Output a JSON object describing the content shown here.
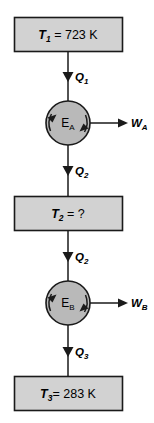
{
  "diagram": {
    "colors": {
      "box_fill": "#d2d2d2",
      "circle_fill": "#b9b9b9",
      "stroke": "#1a1a1a",
      "background": "#ffffff"
    },
    "reservoirs": [
      {
        "id": "reservoir-top",
        "symbol": "T",
        "subscript": "1",
        "equals": " = ",
        "value": "723 K",
        "full_text": "T1 = 723 K"
      },
      {
        "id": "reservoir-middle",
        "symbol": "T",
        "subscript": "2",
        "equals": " = ",
        "value": "?",
        "full_text": "T2 = ?"
      },
      {
        "id": "reservoir-bottom",
        "symbol": "T",
        "subscript": "3",
        "equals": "= ",
        "value": "283 K",
        "full_text": "T3= 283 K"
      }
    ],
    "engines": [
      {
        "id": "engine-a",
        "symbol": "E",
        "subscript": "A",
        "full_text": "EA"
      },
      {
        "id": "engine-b",
        "symbol": "E",
        "subscript": "B",
        "full_text": "EB"
      }
    ],
    "heat_flows": [
      {
        "id": "heat-flow-q1",
        "symbol": "Q",
        "subscript": "1",
        "full_text": "Q1",
        "direction": "down"
      },
      {
        "id": "heat-flow-q2-upper",
        "symbol": "Q",
        "subscript": "2",
        "full_text": "Q2",
        "direction": "down"
      },
      {
        "id": "heat-flow-q2-lower",
        "symbol": "Q",
        "subscript": "2",
        "full_text": "Q2",
        "direction": "down"
      },
      {
        "id": "heat-flow-q3",
        "symbol": "Q",
        "subscript": "3",
        "full_text": "Q3",
        "direction": "down"
      }
    ],
    "work_outputs": [
      {
        "id": "work-output-a",
        "symbol": "W",
        "subscript": "A",
        "full_text": "WA",
        "direction": "right"
      },
      {
        "id": "work-output-b",
        "symbol": "W",
        "subscript": "B",
        "full_text": "WB",
        "direction": "right"
      }
    ]
  }
}
